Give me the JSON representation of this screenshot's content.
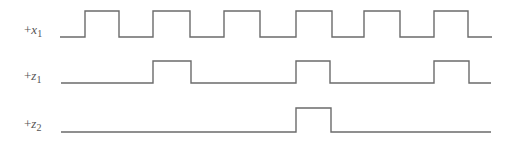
{
  "diagram": {
    "type": "timing-diagram",
    "stroke_color": "#6b6b6b",
    "stroke_width": 1.4,
    "background": "#ffffff",
    "signals": [
      {
        "id": "x1",
        "label": {
          "prefix": "+",
          "var": "x",
          "sub": "1"
        },
        "label_pos": {
          "x": 24,
          "y": 22
        },
        "low_y": 37,
        "high_y": 11,
        "start_x": 60,
        "end_x": 492,
        "pulses": [
          [
            85,
            119
          ],
          [
            153,
            190
          ],
          [
            224,
            260
          ],
          [
            296,
            332
          ],
          [
            364,
            400
          ],
          [
            434,
            468
          ]
        ]
      },
      {
        "id": "z1",
        "label": {
          "prefix": "+",
          "var": "z",
          "sub": "1"
        },
        "label_pos": {
          "x": 24,
          "y": 68
        },
        "low_y": 83,
        "high_y": 61,
        "start_x": 61,
        "end_x": 491,
        "pulses": [
          [
            153,
            191
          ],
          [
            296,
            330
          ],
          [
            434,
            469
          ]
        ]
      },
      {
        "id": "z2",
        "label": {
          "prefix": "+",
          "var": "z",
          "sub": "2"
        },
        "label_pos": {
          "x": 24,
          "y": 116
        },
        "low_y": 132,
        "high_y": 108,
        "start_x": 61,
        "end_x": 491,
        "pulses": [
          [
            296,
            331
          ]
        ]
      }
    ]
  }
}
